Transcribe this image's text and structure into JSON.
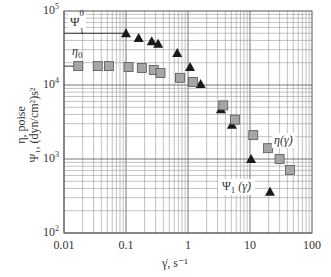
{
  "chart_data": {
    "type": "scatter",
    "title": "",
    "xlabel": "γ̇, s⁻¹",
    "ylabel_line1": "η, poise",
    "ylabel_line2": "Ψ₁, (dyn/cm²)s²",
    "xscale": "log",
    "yscale": "log",
    "xlim": [
      0.01,
      100
    ],
    "ylim": [
      100,
      100000
    ],
    "grid": true,
    "x_ticks": [
      "0.01",
      "0.1",
      "1",
      "10",
      "100"
    ],
    "y_ticks": [
      {
        "base": "10",
        "exp": "2"
      },
      {
        "base": "10",
        "exp": "3"
      },
      {
        "base": "10",
        "exp": "4"
      },
      {
        "base": "10",
        "exp": "5"
      }
    ],
    "series": [
      {
        "name": "Ψ1(γ̇)",
        "marker": "triangle",
        "color": "#1a1a1a",
        "x": [
          0.1,
          0.16,
          0.26,
          0.33,
          0.67,
          1.08,
          1.6,
          3.4,
          5.1,
          10.4,
          21
        ],
        "y": [
          50000,
          43000,
          39000,
          36000,
          27000,
          17500,
          10300,
          4700,
          2900,
          1000,
          360
        ]
      },
      {
        "name": "η(γ̇)",
        "marker": "square",
        "color": "#a6a6a6",
        "x": [
          0.017,
          0.035,
          0.053,
          0.11,
          0.18,
          0.28,
          0.36,
          0.74,
          1.2,
          3.7,
          5.7,
          11.3,
          19.5,
          30,
          44
        ],
        "y": [
          18000,
          18000,
          18000,
          17500,
          17000,
          16000,
          14500,
          12500,
          11000,
          5300,
          3400,
          2100,
          1400,
          1000,
          710
        ]
      }
    ],
    "reference_lines": [
      {
        "name": "Ψ1⁰",
        "y": 50000,
        "x_from": 0.01,
        "x_to": 0.1
      },
      {
        "name": "η0",
        "y": 18000,
        "x_from": 0.01,
        "x_to": 0.017
      }
    ],
    "annotations": [
      {
        "text": "Ψ1⁰",
        "near": "upper-left"
      },
      {
        "text": "η0",
        "near": "upper-left"
      },
      {
        "text": "η(γ̇)",
        "near": "right"
      },
      {
        "text": "Ψ1(γ̇)",
        "near": "lower-right"
      }
    ]
  },
  "labels": {
    "x_ticks": [
      "0.01",
      "0.1",
      "1",
      "10",
      "100"
    ],
    "y_exps": [
      "5",
      "4",
      "3",
      "2"
    ],
    "y_base": "10",
    "ylabel_line1": "η, poise",
    "ylabel_line2": "Ψ₁, (dyn/cm²)s²",
    "xlabel": "γ̇, s⁻¹",
    "psi0": "Ψ",
    "psi0_sub": "1",
    "psi0_sup": "0",
    "eta0": "η",
    "eta0_sub": "0",
    "eta_curve": "η(γ̇)",
    "psi_curve_main": "Ψ",
    "psi_curve_sub": "1",
    "psi_curve_arg": "(γ̇)"
  }
}
